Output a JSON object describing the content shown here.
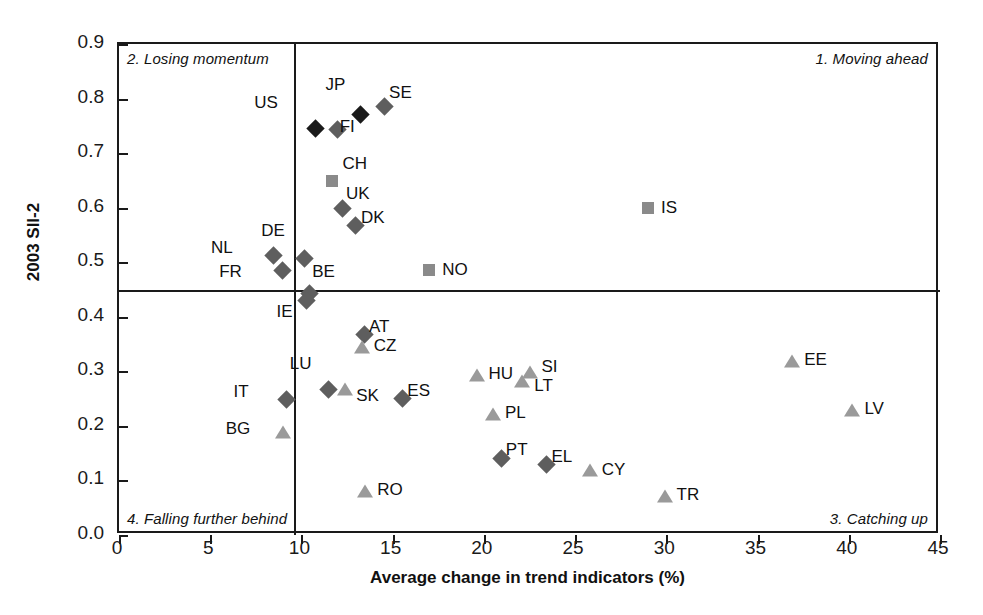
{
  "chart_data": {
    "type": "scatter",
    "title": "",
    "xlabel": "Average change in trend indicators (%)",
    "ylabel": "2003 SII-2",
    "xlim": [
      0,
      45
    ],
    "ylim": [
      0.0,
      0.9
    ],
    "xticks": [
      "0",
      "5",
      "10",
      "15",
      "20",
      "25",
      "30",
      "35",
      "40",
      "45"
    ],
    "xtickvalues": [
      0,
      5,
      10,
      15,
      20,
      25,
      30,
      35,
      40,
      45
    ],
    "yticks": [
      "0.0",
      "0.1",
      "0.2",
      "0.3",
      "0.4",
      "0.5",
      "0.6",
      "0.7",
      "0.8",
      "0.9"
    ],
    "ytickvalues": [
      0.0,
      0.1,
      0.2,
      0.3,
      0.4,
      0.5,
      0.6,
      0.7,
      0.8,
      0.9
    ],
    "grid": false,
    "legend": "none",
    "reference_lines": {
      "horizontal_y": 0.45,
      "vertical_x": 9.6
    },
    "quadrants": [
      {
        "id": "q1",
        "label": "1. Moving ahead",
        "position": "top-right"
      },
      {
        "id": "q2",
        "label": "2. Losing momentum",
        "position": "top-left"
      },
      {
        "id": "q3",
        "label": "3. Catching up",
        "position": "bottom-right"
      },
      {
        "id": "q4",
        "label": "4. Falling further behind",
        "position": "bottom-left"
      }
    ],
    "marker_styles": {
      "black-diamond": {
        "shape": "diamond",
        "color": "#1a1a1a"
      },
      "gray-diamond": {
        "shape": "diamond",
        "color": "#5e5e5e"
      },
      "gray-square": {
        "shape": "square",
        "color": "#8a8a8a"
      },
      "gray-triangle": {
        "shape": "triangle",
        "color": "#9a9a9a"
      }
    },
    "points": [
      {
        "code": "US",
        "x": 10.4,
        "y": 0.757,
        "style": "black-diamond",
        "lx": -27,
        "ly": -20
      },
      {
        "code": "JP",
        "x": 12.9,
        "y": 0.783,
        "style": "black-diamond",
        "lx": -5,
        "ly": -24
      },
      {
        "code": "SE",
        "x": 14.2,
        "y": 0.797,
        "style": "gray-diamond",
        "lx": 11,
        "ly": -8
      },
      {
        "code": "FI",
        "x": 11.6,
        "y": 0.756,
        "style": "gray-diamond",
        "lx": 9,
        "ly": 3
      },
      {
        "code": "CH",
        "x": 11.7,
        "y": 0.648,
        "style": "gray-square",
        "lx": 10,
        "ly": -18
      },
      {
        "code": "UK",
        "x": 11.9,
        "y": 0.61,
        "style": "gray-diamond",
        "lx": 10,
        "ly": -9
      },
      {
        "code": "DK",
        "x": 12.6,
        "y": 0.58,
        "style": "gray-diamond",
        "lx": 12,
        "ly": -2
      },
      {
        "code": "IS",
        "x": 29.0,
        "y": 0.6,
        "style": "gray-square",
        "lx": 13,
        "ly": -1
      },
      {
        "code": "DE",
        "x": 9.8,
        "y": 0.518,
        "style": "gray-diamond",
        "lx": -9,
        "ly": -22
      },
      {
        "code": "NL",
        "x": 8.1,
        "y": 0.525,
        "style": "gray-diamond",
        "lx": -30,
        "ly": -2
      },
      {
        "code": "FR",
        "x": 8.6,
        "y": 0.497,
        "style": "gray-diamond",
        "lx": -30,
        "ly": 7
      },
      {
        "code": "NO",
        "x": 17.0,
        "y": 0.485,
        "style": "gray-square",
        "lx": 13,
        "ly": -1
      },
      {
        "code": "BE",
        "x": 10.1,
        "y": 0.455,
        "style": "gray-diamond",
        "lx": 9,
        "ly": -16
      },
      {
        "code": "IE",
        "x": 9.9,
        "y": 0.442,
        "style": "gray-diamond",
        "lx": -3,
        "ly": 17
      },
      {
        "code": "AT",
        "x": 13.1,
        "y": 0.379,
        "style": "gray-diamond",
        "lx": 11,
        "ly": -2
      },
      {
        "code": "CZ",
        "x": 13.3,
        "y": 0.345,
        "style": "gray-triangle",
        "lx": 12,
        "ly": -2
      },
      {
        "code": "LU",
        "x": 11.1,
        "y": 0.279,
        "style": "gray-diamond",
        "lx": -6,
        "ly": -20
      },
      {
        "code": "SK",
        "x": 12.4,
        "y": 0.268,
        "style": "gray-triangle",
        "lx": 11,
        "ly": 6
      },
      {
        "code": "ES",
        "x": 15.2,
        "y": 0.263,
        "style": "gray-diamond",
        "lx": 11,
        "ly": -2
      },
      {
        "code": "IT",
        "x": 8.8,
        "y": 0.26,
        "style": "gray-diamond",
        "lx": -27,
        "ly": -2
      },
      {
        "code": "BG",
        "x": 9.0,
        "y": 0.189,
        "style": "gray-triangle",
        "lx": -29,
        "ly": -4
      },
      {
        "code": "HU",
        "x": 19.6,
        "y": 0.294,
        "style": "gray-triangle",
        "lx": 12,
        "ly": -2
      },
      {
        "code": "SI",
        "x": 22.5,
        "y": 0.299,
        "style": "gray-triangle",
        "lx": 12,
        "ly": -6
      },
      {
        "code": "LT",
        "x": 22.1,
        "y": 0.282,
        "style": "gray-triangle",
        "lx": 12,
        "ly": 4
      },
      {
        "code": "PL",
        "x": 20.5,
        "y": 0.221,
        "style": "gray-triangle",
        "lx": 12,
        "ly": -2
      },
      {
        "code": "PT",
        "x": 20.6,
        "y": 0.152,
        "style": "gray-diamond",
        "lx": 11,
        "ly": -3
      },
      {
        "code": "EL",
        "x": 23.1,
        "y": 0.141,
        "style": "gray-diamond",
        "lx": 11,
        "ly": -2
      },
      {
        "code": "CY",
        "x": 25.8,
        "y": 0.12,
        "style": "gray-triangle",
        "lx": 12,
        "ly": -1
      },
      {
        "code": "RO",
        "x": 13.5,
        "y": 0.08,
        "style": "gray-triangle",
        "lx": 12,
        "ly": -2
      },
      {
        "code": "TR",
        "x": 29.9,
        "y": 0.071,
        "style": "gray-triangle",
        "lx": 12,
        "ly": -2
      },
      {
        "code": "EE",
        "x": 36.9,
        "y": 0.319,
        "style": "gray-triangle",
        "lx": 12,
        "ly": -2
      },
      {
        "code": "LV",
        "x": 40.2,
        "y": 0.23,
        "style": "gray-triangle",
        "lx": 12,
        "ly": -2
      }
    ]
  }
}
